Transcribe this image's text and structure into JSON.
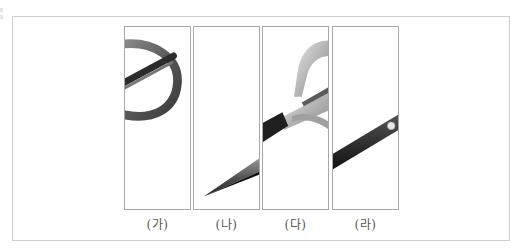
{
  "figure": {
    "panels": [
      {
        "id": "ga",
        "label": "(가)",
        "content": "scissors-handle-ring-fragment"
      },
      {
        "id": "na",
        "label": "(나)",
        "content": "scissors-blade-tip-fragment"
      },
      {
        "id": "da",
        "label": "(다)",
        "content": "scissors-handle-pivot-fragment"
      },
      {
        "id": "ra",
        "label": "(라)",
        "content": "scissors-blade-rivet-fragment"
      }
    ]
  }
}
